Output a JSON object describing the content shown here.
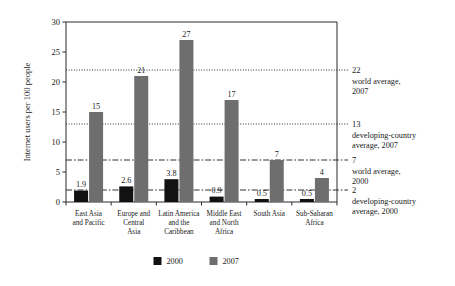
{
  "chart_data": {
    "type": "bar",
    "title": "",
    "xlabel": "",
    "ylabel": "Internet users per 100 people",
    "ylim": [
      0,
      30
    ],
    "yticks": [
      0,
      5,
      10,
      15,
      20,
      25,
      30
    ],
    "grid": false,
    "legend_position": "bottom",
    "categories": [
      "East Asia\nand Pacific",
      "Europe and\nCentral\nAsia",
      "Latin America\nand the\nCaribbean",
      "Middle East\nand North\nAfrica",
      "South Asia",
      "Sub-Saharan\nAfrica"
    ],
    "category_lines": [
      [
        "East Asia",
        "and Pacific"
      ],
      [
        "Europe and",
        "Central",
        "Asia"
      ],
      [
        "Latin America",
        "and the",
        "Caribbean"
      ],
      [
        "Middle East",
        "and North",
        "Africa"
      ],
      [
        "South Asia"
      ],
      [
        "Sub-Saharan",
        "Africa"
      ]
    ],
    "series": [
      {
        "name": "2000",
        "color": "#121212",
        "values": [
          1.9,
          2.6,
          3.8,
          0.9,
          0.5,
          0.5
        ],
        "labels": [
          "1.9",
          "2.6",
          "3.8",
          "0.9",
          "0.5",
          "0.5"
        ]
      },
      {
        "name": "2007",
        "color": "#6e6e6e",
        "values": [
          15,
          21,
          27,
          17,
          7,
          4
        ],
        "labels": [
          "15",
          "21",
          "27",
          "17",
          "7",
          "4"
        ]
      }
    ],
    "reference_lines": [
      {
        "value": 22,
        "value_label": "22",
        "style": "dotted",
        "text_lines": [
          "world average,",
          "2007"
        ]
      },
      {
        "value": 13,
        "value_label": "13",
        "style": "dotted",
        "text_lines": [
          "developing-country",
          "average, 2007"
        ]
      },
      {
        "value": 7,
        "value_label": "7",
        "style": "dashdot",
        "text_lines": [
          "world average,",
          "2000"
        ]
      },
      {
        "value": 2,
        "value_label": "2",
        "style": "dashdot",
        "text_lines": [
          "developing-country",
          "average, 2000"
        ]
      }
    ]
  }
}
